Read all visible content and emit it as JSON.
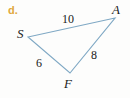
{
  "item": {
    "letter": "d."
  },
  "figure": {
    "type": "triangle-diagram",
    "stroke_color": "#7fa8c4",
    "background_color": "#fdfdfc",
    "letter_color": "#e0a83c",
    "text_color": "#1a1a1a",
    "vertices": [
      {
        "name": "A",
        "label": "A",
        "x": 115,
        "y": 18
      },
      {
        "name": "S",
        "label": "S",
        "x": 28,
        "y": 37
      },
      {
        "name": "F",
        "label": "F",
        "x": 70,
        "y": 73
      }
    ],
    "sides": [
      {
        "name": "SA",
        "label": "10",
        "from": "S",
        "to": "A"
      },
      {
        "name": "SF",
        "label": "6",
        "from": "S",
        "to": "F"
      },
      {
        "name": "FA",
        "label": "8",
        "from": "F",
        "to": "A"
      }
    ]
  }
}
